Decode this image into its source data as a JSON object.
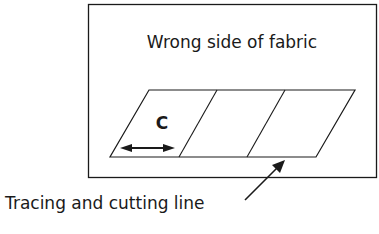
{
  "diagram": {
    "fabric_label": "Wrong side of fabric",
    "width_label": "C",
    "pointer_label": "Tracing and cutting line",
    "segments": 3,
    "colors": {
      "line": "#1a1a1a",
      "background": "#ffffff"
    }
  }
}
